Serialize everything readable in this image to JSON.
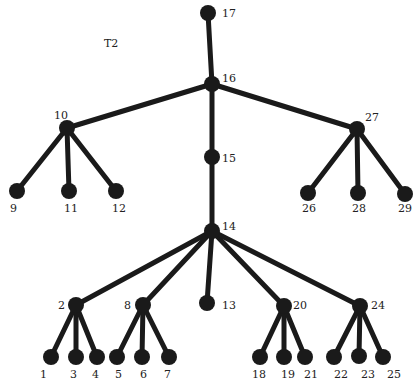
{
  "title": "T2",
  "colors": {
    "ink": "#1a1a1a",
    "background": "#ffffff"
  },
  "nodes": [
    {
      "id": "17",
      "x": 208,
      "y": 13,
      "lx": 222,
      "ly": 17
    },
    {
      "id": "16",
      "x": 212,
      "y": 84,
      "lx": 222,
      "ly": 82
    },
    {
      "id": "15",
      "x": 212,
      "y": 157,
      "lx": 222,
      "ly": 162
    },
    {
      "id": "14",
      "x": 212,
      "y": 231,
      "lx": 222,
      "ly": 230
    },
    {
      "id": "10",
      "x": 67,
      "y": 128,
      "lx": 54,
      "ly": 119
    },
    {
      "id": "27",
      "x": 357,
      "y": 129,
      "lx": 365,
      "ly": 121
    },
    {
      "id": "9",
      "x": 17,
      "y": 191,
      "lx": 10,
      "ly": 212
    },
    {
      "id": "11",
      "x": 69,
      "y": 191,
      "lx": 64,
      "ly": 212
    },
    {
      "id": "12",
      "x": 116,
      "y": 191,
      "lx": 112,
      "ly": 212
    },
    {
      "id": "26",
      "x": 308,
      "y": 193,
      "lx": 302,
      "ly": 212
    },
    {
      "id": "28",
      "x": 358,
      "y": 193,
      "lx": 352,
      "ly": 212
    },
    {
      "id": "29",
      "x": 405,
      "y": 194,
      "lx": 398,
      "ly": 212
    },
    {
      "id": "2",
      "x": 76,
      "y": 305,
      "lx": 58,
      "ly": 309
    },
    {
      "id": "8",
      "x": 143,
      "y": 305,
      "lx": 124,
      "ly": 309
    },
    {
      "id": "13",
      "x": 207,
      "y": 303,
      "lx": 222,
      "ly": 309
    },
    {
      "id": "20",
      "x": 284,
      "y": 306,
      "lx": 293,
      "ly": 309
    },
    {
      "id": "24",
      "x": 360,
      "y": 306,
      "lx": 371,
      "ly": 309
    },
    {
      "id": "1",
      "x": 51,
      "y": 357,
      "lx": 40,
      "ly": 378
    },
    {
      "id": "3",
      "x": 76,
      "y": 357,
      "lx": 70,
      "ly": 378
    },
    {
      "id": "4",
      "x": 97,
      "y": 357,
      "lx": 92,
      "ly": 378
    },
    {
      "id": "5",
      "x": 117,
      "y": 357,
      "lx": 115,
      "ly": 378
    },
    {
      "id": "6",
      "x": 142,
      "y": 357,
      "lx": 140,
      "ly": 378
    },
    {
      "id": "7",
      "x": 169,
      "y": 357,
      "lx": 164,
      "ly": 378
    },
    {
      "id": "18",
      "x": 260,
      "y": 357,
      "lx": 252,
      "ly": 378
    },
    {
      "id": "19",
      "x": 284,
      "y": 357,
      "lx": 281,
      "ly": 378
    },
    {
      "id": "21",
      "x": 305,
      "y": 357,
      "lx": 304,
      "ly": 378
    },
    {
      "id": "22",
      "x": 334,
      "y": 357,
      "lx": 334,
      "ly": 378
    },
    {
      "id": "23",
      "x": 359,
      "y": 356,
      "lx": 361,
      "ly": 378
    },
    {
      "id": "25",
      "x": 383,
      "y": 357,
      "lx": 387,
      "ly": 378
    }
  ],
  "edges": [
    [
      "17",
      "16"
    ],
    [
      "16",
      "15"
    ],
    [
      "15",
      "14"
    ],
    [
      "16",
      "10"
    ],
    [
      "16",
      "27"
    ],
    [
      "10",
      "9"
    ],
    [
      "10",
      "11"
    ],
    [
      "10",
      "12"
    ],
    [
      "27",
      "26"
    ],
    [
      "27",
      "28"
    ],
    [
      "27",
      "29"
    ],
    [
      "14",
      "2"
    ],
    [
      "14",
      "8"
    ],
    [
      "14",
      "13"
    ],
    [
      "14",
      "20"
    ],
    [
      "14",
      "24"
    ],
    [
      "2",
      "1"
    ],
    [
      "2",
      "3"
    ],
    [
      "2",
      "4"
    ],
    [
      "8",
      "5"
    ],
    [
      "8",
      "6"
    ],
    [
      "8",
      "7"
    ],
    [
      "20",
      "18"
    ],
    [
      "20",
      "19"
    ],
    [
      "20",
      "21"
    ],
    [
      "24",
      "22"
    ],
    [
      "24",
      "23"
    ],
    [
      "24",
      "25"
    ]
  ]
}
